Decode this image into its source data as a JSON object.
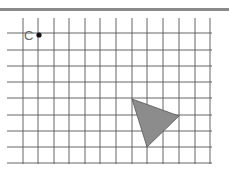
{
  "diagram": {
    "type": "grid-transformation",
    "grid": {
      "vertical_x": [
        23,
        38,
        54,
        69,
        85,
        100,
        116,
        132,
        147,
        163,
        179,
        195,
        210
      ],
      "horizontal_y": [
        33,
        50,
        66,
        82,
        98,
        115,
        131,
        147,
        163
      ],
      "x_extent": [
        7,
        212
      ],
      "y_extent": [
        18,
        164
      ],
      "line_color": "#555555"
    },
    "point": {
      "label": "C",
      "x": 39,
      "y": 35,
      "color": "#111111"
    },
    "triangle": {
      "vertices": [
        [
          132,
          99
        ],
        [
          179,
          116
        ],
        [
          147,
          147
        ]
      ],
      "fill": "#8c8c8c",
      "stroke": "#555555"
    },
    "header_bar_color": "#8a8a8a"
  }
}
